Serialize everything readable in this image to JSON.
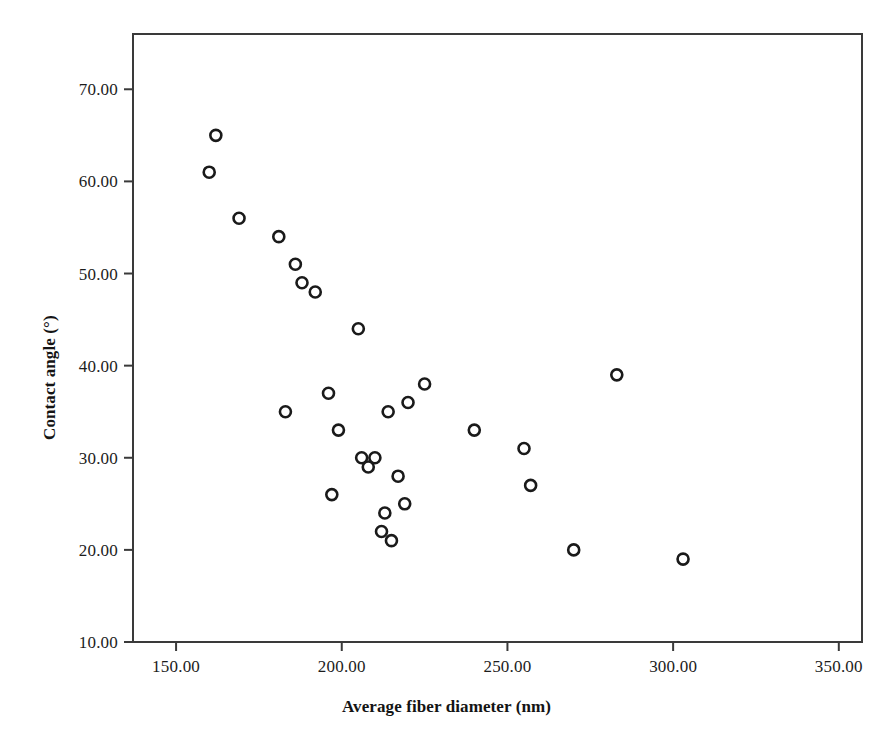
{
  "chart_data": {
    "type": "scatter",
    "title": "",
    "subtitle": "",
    "xlabel": "Average fiber diameter (nm)",
    "ylabel": "Contact angle (°)",
    "xlim": [
      137,
      357
    ],
    "ylim": [
      10,
      76
    ],
    "xticks": [
      150,
      200,
      250,
      300,
      350
    ],
    "xticklabels": [
      "150.00",
      "200.00",
      "250.00",
      "300.00",
      "350.00"
    ],
    "yticks": [
      10,
      20,
      30,
      40,
      50,
      60,
      70
    ],
    "yticklabels": [
      "10.00",
      "20.00",
      "30.00",
      "40.00",
      "50.00",
      "60.00",
      "70.00"
    ],
    "grid": false,
    "legend": null,
    "marker": {
      "shape": "circle-open",
      "edge_color": "#1a1a1a",
      "face_color": "#ffffff",
      "size_px": 11,
      "edge_width_px": 2.6
    },
    "series": [
      {
        "name": "Electrospun fiber samples",
        "x": [
          162,
          160,
          169,
          181,
          186,
          188,
          192,
          205,
          183,
          196,
          199,
          206,
          210,
          208,
          214,
          220,
          217,
          197,
          213,
          215,
          212,
          219,
          225,
          240,
          255,
          257,
          270,
          283,
          303
        ],
        "y": [
          65,
          61,
          56,
          54,
          51,
          49,
          48,
          44,
          35,
          37,
          33,
          30,
          30,
          29,
          35,
          36,
          28,
          26,
          24,
          21,
          22,
          25,
          38,
          33,
          31,
          27,
          20,
          39,
          19
        ]
      }
    ],
    "points": [
      {
        "x": 162,
        "y": 65
      },
      {
        "x": 160,
        "y": 61
      },
      {
        "x": 169,
        "y": 56
      },
      {
        "x": 181,
        "y": 54
      },
      {
        "x": 186,
        "y": 51
      },
      {
        "x": 188,
        "y": 49
      },
      {
        "x": 192,
        "y": 48
      },
      {
        "x": 205,
        "y": 44
      },
      {
        "x": 183,
        "y": 35
      },
      {
        "x": 196,
        "y": 37
      },
      {
        "x": 199,
        "y": 33
      },
      {
        "x": 206,
        "y": 30
      },
      {
        "x": 210,
        "y": 30
      },
      {
        "x": 208,
        "y": 29
      },
      {
        "x": 214,
        "y": 35
      },
      {
        "x": 220,
        "y": 36
      },
      {
        "x": 217,
        "y": 28
      },
      {
        "x": 197,
        "y": 26
      },
      {
        "x": 213,
        "y": 24
      },
      {
        "x": 215,
        "y": 21
      },
      {
        "x": 212,
        "y": 22
      },
      {
        "x": 219,
        "y": 25
      },
      {
        "x": 225,
        "y": 38
      },
      {
        "x": 240,
        "y": 33
      },
      {
        "x": 255,
        "y": 31
      },
      {
        "x": 257,
        "y": 27
      },
      {
        "x": 270,
        "y": 20
      },
      {
        "x": 283,
        "y": 39
      },
      {
        "x": 303,
        "y": 19
      }
    ],
    "n_points": 29,
    "frame": {
      "left_px": 133,
      "right_px": 862,
      "top_px": 34,
      "bottom_px": 642,
      "color": "#3a3a3a",
      "line_width_px": 2
    }
  }
}
